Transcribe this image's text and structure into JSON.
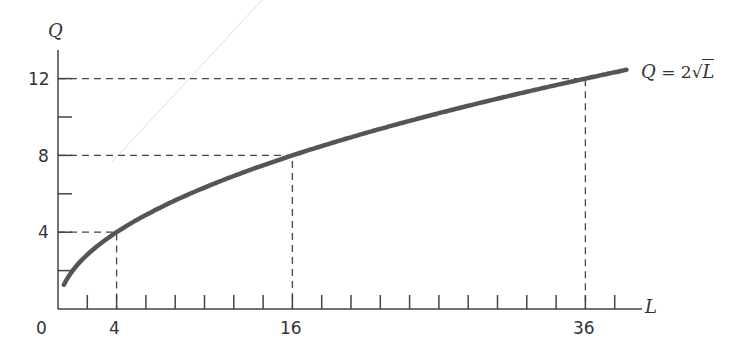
{
  "chart_data": {
    "type": "line",
    "title": "",
    "xlabel": "L",
    "ylabel": "Q",
    "equation_label": "Q = 2√L",
    "function": "Q = 2*sqrt(L)",
    "x": [
      0.5,
      1,
      2,
      4,
      8,
      12,
      16,
      20,
      24,
      28,
      32,
      36,
      39
    ],
    "series": [
      {
        "name": "Q = 2√L",
        "values": [
          1.41,
          2,
          2.83,
          4,
          5.66,
          6.93,
          8,
          8.94,
          9.8,
          10.58,
          11.31,
          12,
          12.49
        ]
      }
    ],
    "highlighted_points": [
      {
        "L": 4,
        "Q": 4
      },
      {
        "L": 16,
        "Q": 8
      },
      {
        "L": 36,
        "Q": 12
      }
    ],
    "x_tick_labels": [
      "0",
      "4",
      "16",
      "36"
    ],
    "y_tick_labels": [
      "4",
      "8",
      "12"
    ],
    "x_tick_interval": 2,
    "y_tick_interval": 2,
    "xlim": [
      0,
      40
    ],
    "ylim": [
      0,
      13
    ],
    "grid": false,
    "legend": "none",
    "guides": "dashed lines to highlighted points"
  },
  "labels": {
    "y_axis": "Q",
    "x_axis": "L",
    "origin": "0",
    "x4": "4",
    "x16": "16",
    "x36": "36",
    "y4": "4",
    "y8": "8",
    "y12": "12",
    "eq_q": "Q",
    "eq_mid": " = 2",
    "eq_l": "L"
  }
}
